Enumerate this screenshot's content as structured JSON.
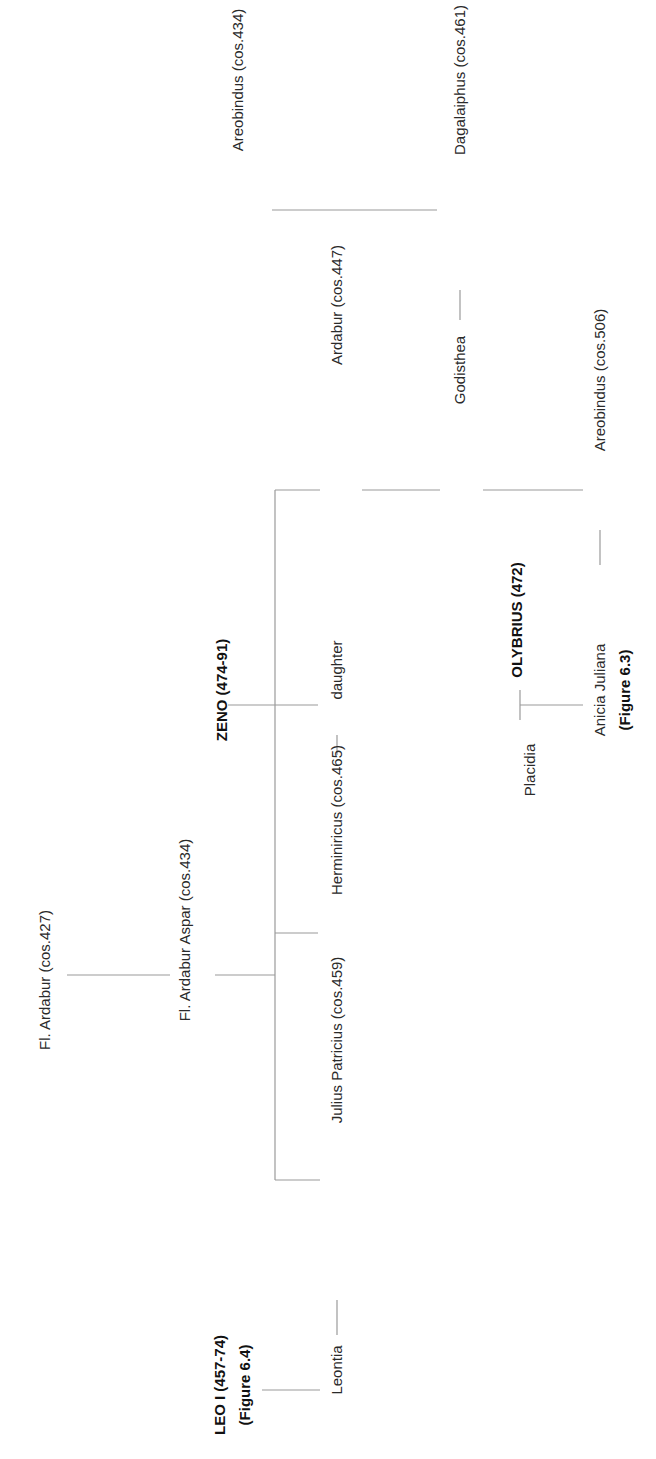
{
  "diagram": {
    "type": "family-tree",
    "orientation": "rotated-90-ccw",
    "line_color": "#9a9a9a",
    "people": {
      "fl_ardabur": {
        "label": "Fl. Ardabur (cos.427)",
        "x": 45,
        "y": 980,
        "bold": false
      },
      "fl_ardabur_aspar": {
        "label": "Fl. Ardabur Aspar (cos.434)",
        "x": 185,
        "y": 930,
        "bold": false
      },
      "zeno": {
        "label": "ZENO (474-91)",
        "x": 222,
        "y": 690,
        "bold": true
      },
      "leo_i": {
        "label": "LEO I (457-74)",
        "x": 220,
        "y": 1385,
        "bold": true
      },
      "leo_i_ref": {
        "label": "(Figure 6.4)",
        "x": 245,
        "y": 1385,
        "bold": true
      },
      "areobindus_434": {
        "label": "Areobindus (cos.434)",
        "x": 238,
        "y": 80,
        "bold": false
      },
      "dagalaiphus": {
        "label": "Dagalaiphus  (cos.461)",
        "x": 460,
        "y": 80,
        "bold": false
      },
      "ardabur_447": {
        "label": "Ardabur (cos.447)",
        "x": 337,
        "y": 305,
        "bold": false
      },
      "godisthea": {
        "label": "Godisthea",
        "x": 460,
        "y": 370,
        "bold": false
      },
      "areobindus_506": {
        "label": "Areobindus  (cos.506)",
        "x": 600,
        "y": 380,
        "bold": false
      },
      "daughter": {
        "label": "daughter",
        "x": 337,
        "y": 670,
        "bold": false
      },
      "herminiricus": {
        "label": "Herminiricus (cos.465)",
        "x": 337,
        "y": 820,
        "bold": false
      },
      "julius_patricius": {
        "label": "Julius Patricius (cos.459)",
        "x": 337,
        "y": 1040,
        "bold": false
      },
      "leontia": {
        "label": "Leontia",
        "x": 337,
        "y": 1370,
        "bold": false
      },
      "olybrius": {
        "label": "OLYBRIUS (472)",
        "x": 517,
        "y": 620,
        "bold": true
      },
      "placidia": {
        "label": "Placidia",
        "x": 530,
        "y": 770,
        "bold": false
      },
      "anicia_juliana": {
        "label": "Anicia Juliana",
        "x": 600,
        "y": 690,
        "bold": false
      },
      "anicia_juliana_ref": {
        "label": "(Figure 6.3)",
        "x": 625,
        "y": 690,
        "bold": true
      }
    },
    "relations": [
      {
        "type": "parent-child",
        "parent": "Fl. Ardabur (cos.427)",
        "child": "Fl. Ardabur Aspar (cos.434)"
      },
      {
        "type": "parent-child",
        "parent": "Fl. Ardabur Aspar (cos.434)",
        "child": "Ardabur (cos.447)"
      },
      {
        "type": "parent-child",
        "parent": "Fl. Ardabur Aspar (cos.434)",
        "child": "daughter"
      },
      {
        "type": "parent-child",
        "parent": "Fl. Ardabur Aspar (cos.434)",
        "child": "Herminiricus (cos.465)"
      },
      {
        "type": "parent-child",
        "parent": "Fl. Ardabur Aspar (cos.434)",
        "child": "Julius Patricius (cos.459)"
      },
      {
        "type": "marriage",
        "a": "ZENO (474-91)",
        "b": "daughter"
      },
      {
        "type": "marriage",
        "a": "Herminiricus (cos.465)",
        "b": "daughter"
      },
      {
        "type": "marriage",
        "a": "Julius Patricius (cos.459)",
        "b": "Leontia"
      },
      {
        "type": "parent-child",
        "parent": "LEO I (457-74)",
        "child": "Leontia"
      },
      {
        "type": "parent-child",
        "parent": "Ardabur (cos.447)",
        "child": "Godisthea"
      },
      {
        "type": "parent-child",
        "parent": "Areobindus (cos.434)",
        "child": "Dagalaiphus  (cos.461)"
      },
      {
        "type": "marriage",
        "a": "Dagalaiphus  (cos.461)",
        "b": "Godisthea"
      },
      {
        "type": "parent-child",
        "parent": "Godisthea",
        "child": "Areobindus  (cos.506)"
      },
      {
        "type": "marriage",
        "a": "Anicia Juliana",
        "b": "Areobindus  (cos.506)"
      },
      {
        "type": "marriage",
        "a": "Placidia",
        "b": "OLYBRIUS (472)"
      },
      {
        "type": "parent-child",
        "parent": "OLYBRIUS (472)",
        "child": "Anicia Juliana"
      }
    ]
  }
}
